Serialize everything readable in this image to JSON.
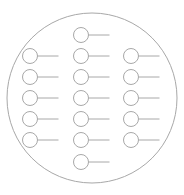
{
  "diagram": {
    "width": 184,
    "height": 195,
    "stroke_color": "#a8a8a8",
    "outer_circle": {
      "cx": 92,
      "cy": 98,
      "r": 85
    },
    "node_radius": 7.5,
    "line_length": 21,
    "columns": [
      {
        "name": "left",
        "cx": 30,
        "rows": [
          56,
          77,
          98,
          119,
          140
        ]
      },
      {
        "name": "middle",
        "cx": 81,
        "rows": [
          35,
          56,
          77,
          98,
          119,
          140,
          162
        ]
      },
      {
        "name": "right",
        "cx": 131,
        "rows": [
          56,
          77,
          98,
          119,
          140
        ]
      }
    ]
  }
}
